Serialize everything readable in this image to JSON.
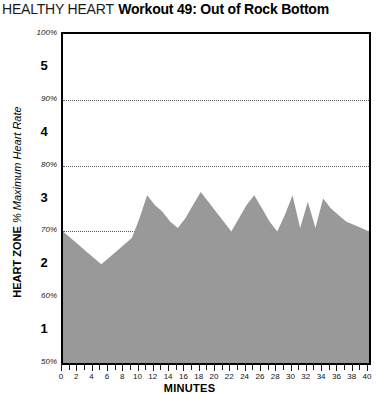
{
  "title": {
    "brand": "HEALTHY HEART",
    "workout": "Workout 49: Out of Rock Bottom"
  },
  "yaxis": {
    "title_bold": "HEART ZONE",
    "title_italic": "% Maximum Heart Rate",
    "tick_labels": [
      "50%",
      "60%",
      "70%",
      "80%",
      "90%",
      "100%"
    ],
    "zone_labels": [
      "1",
      "2",
      "3",
      "4",
      "5"
    ]
  },
  "xaxis": {
    "title": "MINUTES",
    "tick_labels": [
      "0",
      "2",
      "4",
      "6",
      "8",
      "10",
      "12",
      "14",
      "16",
      "18",
      "20",
      "22",
      "24",
      "26",
      "28",
      "30",
      "32",
      "34",
      "36",
      "38",
      "40"
    ]
  },
  "colors": {
    "fill": "#999999",
    "axis": "#000000",
    "grid": "#555555",
    "background": "#ffffff"
  },
  "chart_data": {
    "type": "area",
    "title": "Workout 49: Out of Rock Bottom",
    "subtitle": "HEALTHY HEART",
    "xlabel": "MINUTES",
    "ylabel": "HEART ZONE % Maximum Heart Rate",
    "xlim": [
      0,
      40
    ],
    "ylim": [
      50,
      100
    ],
    "xtick_step": 2,
    "xtick_minor_step": 1,
    "ytick_step": 10,
    "grid": true,
    "grid_axis": "y",
    "legend": null,
    "zones": [
      {
        "label": "1",
        "range": [
          50,
          60
        ]
      },
      {
        "label": "2",
        "range": [
          60,
          70
        ]
      },
      {
        "label": "3",
        "range": [
          70,
          80
        ]
      },
      {
        "label": "4",
        "range": [
          80,
          90
        ]
      },
      {
        "label": "5",
        "range": [
          90,
          100
        ]
      }
    ],
    "series": [
      {
        "name": "% Maximum Heart Rate",
        "x": [
          0,
          1,
          2,
          3,
          4,
          5,
          6,
          7,
          8,
          9,
          10,
          11,
          12,
          13,
          14,
          15,
          16,
          17,
          18,
          19,
          20,
          21,
          22,
          23,
          24,
          25,
          26,
          27,
          28,
          29,
          30,
          31,
          32,
          33,
          34,
          35,
          36,
          37,
          38,
          39,
          40
        ],
        "y": [
          70,
          69,
          68,
          67,
          66,
          65,
          66,
          67,
          68,
          69,
          72,
          75.5,
          74,
          73,
          71.5,
          70.5,
          72,
          74,
          76,
          74.5,
          73,
          71.5,
          70,
          72,
          74,
          75.5,
          73.5,
          71.5,
          70,
          72.5,
          75.5,
          70.5,
          74.5,
          70.5,
          75,
          73.5,
          72.5,
          71.5,
          71,
          70.5,
          70
        ]
      }
    ]
  }
}
